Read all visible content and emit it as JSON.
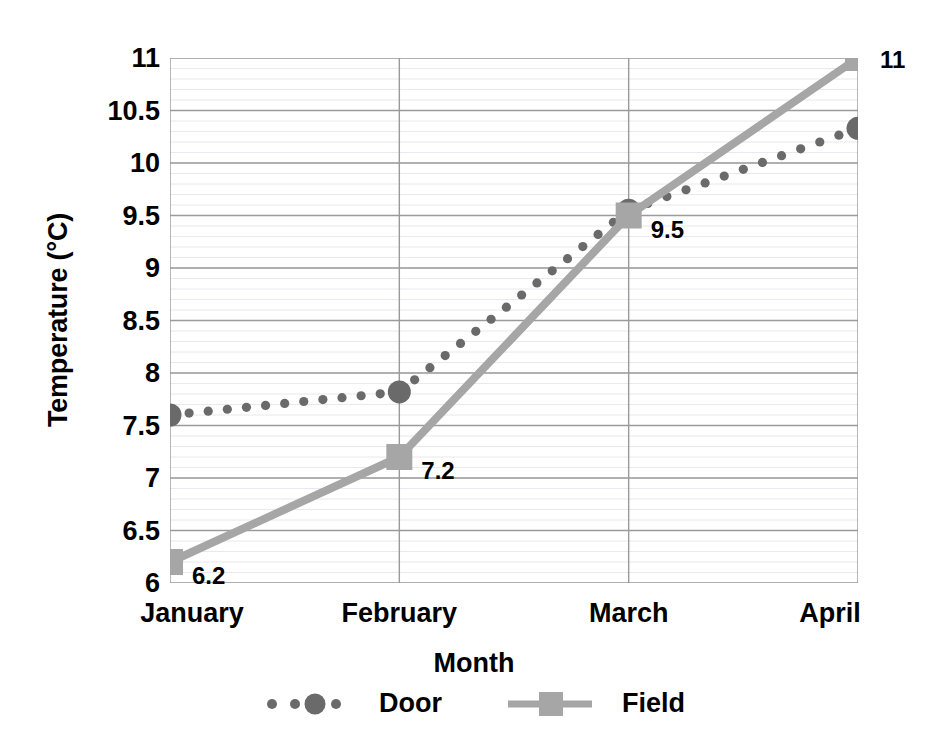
{
  "chart_data": {
    "type": "line",
    "title": "",
    "xlabel": "Month",
    "ylabel": "Temperature (°C)",
    "categories": [
      "January",
      "February",
      "March",
      "April"
    ],
    "ylim": [
      6,
      11
    ],
    "yticks": [
      "6",
      "6.5",
      "7",
      "7.5",
      "8",
      "8.5",
      "9",
      "9.5",
      "10",
      "10.5",
      "11"
    ],
    "ytick_values": [
      6,
      6.5,
      7,
      7.5,
      8,
      8.5,
      9,
      9.5,
      10,
      10.5,
      11
    ],
    "grid": "major horizontal and vertical gridlines, faint minor horizontal lines",
    "legend_position": "bottom-center-below-xlabel",
    "series": [
      {
        "name": "Door",
        "values": [
          7.6,
          7.82,
          9.55,
          10.33
        ],
        "line_style": "dotted",
        "marker": "circle",
        "color": "#6a6a6a",
        "labels_shown": false,
        "data_labels": [
          "",
          "",
          "",
          ""
        ]
      },
      {
        "name": "Field",
        "values": [
          6.2,
          7.2,
          9.5,
          11
        ],
        "line_style": "solid",
        "marker": "square",
        "color": "#a6a6a6",
        "labels_shown": true,
        "data_labels": [
          "6.2",
          "7.2",
          "9.5",
          "11"
        ]
      }
    ]
  },
  "axes": {
    "y_title": "Temperature (°C)",
    "x_title": "Month"
  },
  "legend": {
    "entries": [
      {
        "label": "Door",
        "marker": "dotted-circle-marker"
      },
      {
        "label": "Field",
        "marker": "solid-square-marker"
      }
    ]
  },
  "colors": {
    "door": "#6a6a6a",
    "field": "#a6a6a6",
    "gridline_major": "#9a9a9a",
    "gridline_minor": "#e8e8ee",
    "text": "#000000",
    "background": "#ffffff"
  }
}
